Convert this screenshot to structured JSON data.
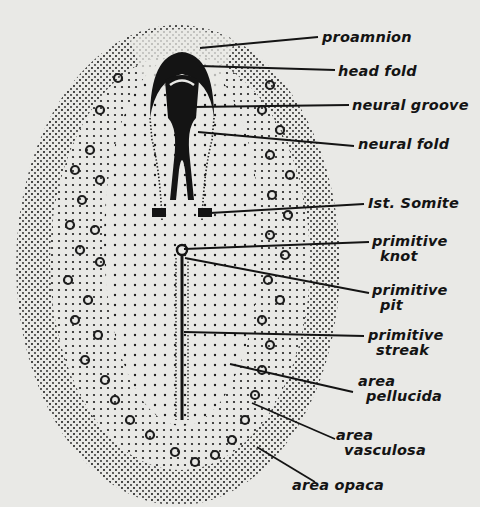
{
  "diagram": {
    "colors": {
      "background": "#e9e9e6",
      "ink": "#141414"
    },
    "labels": [
      {
        "id": "proamnion",
        "lines": [
          "proamnion"
        ],
        "x": 322,
        "y": 30,
        "target": [
          200,
          48
        ],
        "anchor": [
          318,
          37
        ]
      },
      {
        "id": "head-fold",
        "lines": [
          "head fold"
        ],
        "x": 338,
        "y": 64,
        "target": [
          200,
          66
        ],
        "anchor": [
          335,
          70
        ]
      },
      {
        "id": "neural-groove",
        "lines": [
          "neural groove"
        ],
        "x": 352,
        "y": 98,
        "target": [
          192,
          107
        ],
        "anchor": [
          349,
          105
        ]
      },
      {
        "id": "neural-fold",
        "lines": [
          "neural fold"
        ],
        "x": 358,
        "y": 137,
        "target": [
          198,
          132
        ],
        "anchor": [
          354,
          146
        ]
      },
      {
        "id": "first-somite",
        "lines": [
          "Ist. Somite"
        ],
        "x": 368,
        "y": 196,
        "target": [
          210,
          213
        ],
        "anchor": [
          364,
          204
        ]
      },
      {
        "id": "primitive-knot",
        "lines": [
          "primitive",
          "knot"
        ],
        "x": 372,
        "y": 234,
        "target": [
          184,
          249
        ],
        "anchor": [
          369,
          242
        ]
      },
      {
        "id": "primitive-pit",
        "lines": [
          "primitive",
          "pit"
        ],
        "x": 372,
        "y": 283,
        "target": [
          185,
          258
        ],
        "anchor": [
          369,
          293
        ]
      },
      {
        "id": "primitive-streak",
        "lines": [
          "primitive",
          "streak"
        ],
        "x": 368,
        "y": 328,
        "target": [
          184,
          332
        ],
        "anchor": [
          364,
          336
        ]
      },
      {
        "id": "area-pellucida",
        "lines": [
          "area",
          "pellucida"
        ],
        "x": 358,
        "y": 374,
        "target": [
          230,
          364
        ],
        "anchor": [
          353,
          392
        ]
      },
      {
        "id": "area-vasculosa",
        "lines": [
          "area",
          "vasculosa"
        ],
        "x": 336,
        "y": 428,
        "target": [
          252,
          403
        ],
        "anchor": [
          335,
          439
        ]
      },
      {
        "id": "area-opaca",
        "lines": [
          "area opaca"
        ],
        "x": 292,
        "y": 478,
        "target": [
          257,
          447
        ],
        "anchor": [
          315,
          482
        ]
      }
    ]
  }
}
